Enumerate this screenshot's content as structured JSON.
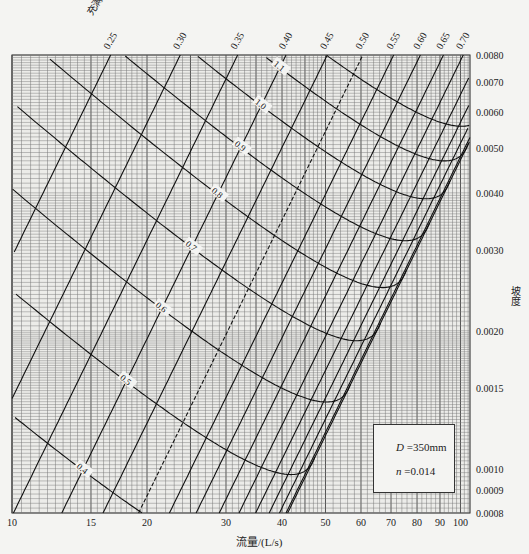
{
  "chart_data": {
    "type": "line",
    "title": "",
    "xlabel": "流量/(L/s)",
    "ylabel": "坡度",
    "x_scale": "log",
    "y_scale": "log",
    "xlim": [
      10,
      105
    ],
    "ylim": [
      0.0008,
      0.008
    ],
    "grid": true,
    "x_ticks": [
      "10",
      "15",
      "20",
      "30",
      "40",
      "50",
      "60",
      "70",
      "80",
      "90",
      "100"
    ],
    "y_ticks": [
      "0.0080",
      "0.0070",
      "0.0060",
      "0.0050",
      "0.0040",
      "0.0030",
      "0.0020",
      "0.0015",
      "0.0010",
      "0.0009",
      "0.0008"
    ],
    "fullness_axis_label": "充满度 h/D",
    "fullness_labels": [
      "0.25",
      "0.30",
      "0.35",
      "0.40",
      "0.45",
      "0.50",
      "0.55",
      "0.60",
      "0.65",
      "0.70",
      "0.75",
      "0.80",
      "0.85",
      "0.90",
      "0.95"
    ],
    "velocity_axis_label": "流速(m/s)",
    "velocity_labels": [
      "0.4",
      "0.5",
      "0.6",
      "0.7",
      "0.8",
      "0.9",
      "1.0",
      "1.1",
      "1.2"
    ],
    "parameters": {
      "D": "350mm",
      "n": "0.014"
    },
    "series_note": "Constant h/D lines (fullness, rising left-to-right) and constant velocity lines (falling left-to-right) on log-log slope vs flow nomogram for D=350mm, n=0.014"
  },
  "legend": {
    "d_label": "D",
    "d_value": " =350mm",
    "n_label": "n",
    "n_value": " =0.014"
  },
  "axes": {
    "x_title": "流量/(L/s)",
    "y_title": "坡度",
    "top_title": "充满度 h/D"
  }
}
